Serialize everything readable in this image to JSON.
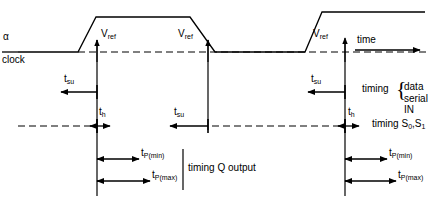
{
  "figure": {
    "type": "timing-diagram",
    "title": "",
    "background_color": "#ffffff",
    "line_color": "#000000",
    "width": 429,
    "height": 200
  },
  "clock_label": {
    "numerator": "α",
    "denominator": "clock"
  },
  "threshold_labels": [
    {
      "id": "vref-1",
      "text": "V",
      "sub": "ref"
    },
    {
      "id": "vref-2",
      "text": "V",
      "sub": "ref"
    },
    {
      "id": "vref-3",
      "text": "V",
      "sub": "ref"
    }
  ],
  "time_axis": {
    "label": "time"
  },
  "measurements": [
    {
      "id": "tsu-1",
      "text": "t",
      "sub": "su",
      "arrow": "left"
    },
    {
      "id": "th-1",
      "text": "t",
      "sub": "h",
      "arrow": "double"
    },
    {
      "id": "tsu-2",
      "text": "t",
      "sub": "su",
      "arrow": "double"
    },
    {
      "id": "tsu-3",
      "text": "t",
      "sub": "su",
      "arrow": "double"
    },
    {
      "id": "th-2",
      "text": "t",
      "sub": "h",
      "arrow": "double"
    },
    {
      "id": "tpmin-1",
      "text": "t",
      "sub": "P(min)",
      "arrow": "double"
    },
    {
      "id": "tpmax-1",
      "text": "t",
      "sub": "P(max)",
      "arrow": "double"
    },
    {
      "id": "tpmin-2",
      "text": "t",
      "sub": "P(min)",
      "arrow": "right"
    },
    {
      "id": "tpmax-2",
      "text": "t",
      "sub": "P(max)",
      "arrow": "right"
    }
  ],
  "annotations": {
    "timing_data_serial": {
      "prefix": "timing",
      "brace": "{",
      "line1": "data",
      "line2": "serial  IN"
    },
    "timing_s0_s1": {
      "text": "timing S",
      "sub1": "0",
      "sep": ",S",
      "sub2": "1"
    },
    "timing_q_output": {
      "text": "timing Q output"
    }
  },
  "waveform": {
    "description": "clock signal: low, rising edge, high plateau, falling edge, low, rising edge, high",
    "low_level_y": 52,
    "high_level_y": 17,
    "vref_crossing_y": 52,
    "points": "18,52 78,52 96,17 190,17 215,52 305,52 322,12 425,12"
  },
  "reference_lines": {
    "dashed_clock_ref_y": 52,
    "dashed_lower_ref_y": 126,
    "vertical_edges_x": [
      97,
      208,
      345
    ]
  }
}
